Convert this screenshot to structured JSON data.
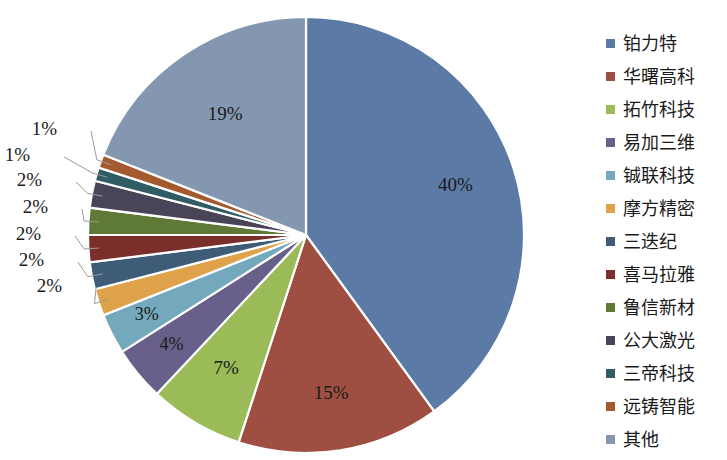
{
  "chart_data": {
    "type": "pie",
    "title": "",
    "categories": [
      "铂力特",
      "华曙高科",
      "拓竹科技",
      "易加三维",
      "铖联科技",
      "摩方精密",
      "三迭纪",
      "喜马拉雅",
      "鲁信新材",
      "公大激光",
      "三帝科技",
      "远铸智能",
      "其他"
    ],
    "values": [
      40,
      15,
      7,
      4,
      3,
      2,
      2,
      2,
      2,
      2,
      1,
      1,
      19
    ],
    "value_labels": [
      "40%",
      "15%",
      "7%",
      "4%",
      "3%",
      "2%",
      "2%",
      "2%",
      "2%",
      "2%",
      "1%",
      "1%",
      "19%"
    ],
    "colors": [
      "#5B7BA6",
      "#9E4F42",
      "#9BBB59",
      "#68608B",
      "#74A8BC",
      "#E0A14B",
      "#3E5C78",
      "#7B2F2B",
      "#5F7A36",
      "#4A4458",
      "#2F5D63",
      "#A35A2E",
      "#8497B0"
    ],
    "legend_position": "right",
    "start_angle_deg": 0,
    "direction": "clockwise",
    "grid": false,
    "xlabel": "",
    "ylabel": ""
  },
  "legend": {
    "items": [
      {
        "label": "铂力特",
        "color": "#5B7BA6"
      },
      {
        "label": "华曙高科",
        "color": "#9E4F42"
      },
      {
        "label": "拓竹科技",
        "color": "#9BBB59"
      },
      {
        "label": "易加三维",
        "color": "#68608B"
      },
      {
        "label": "铖联科技",
        "color": "#74A8BC"
      },
      {
        "label": "摩方精密",
        "color": "#E0A14B"
      },
      {
        "label": "三迭纪",
        "color": "#3E5C78"
      },
      {
        "label": "喜马拉雅",
        "color": "#7B2F2B"
      },
      {
        "label": "鲁信新材",
        "color": "#5F7A36"
      },
      {
        "label": "公大激光",
        "color": "#4A4458"
      },
      {
        "label": "三帝科技",
        "color": "#2F5D63"
      },
      {
        "label": "远铸智能",
        "color": "#A35A2E"
      },
      {
        "label": "其他",
        "color": "#8497B0"
      }
    ]
  }
}
